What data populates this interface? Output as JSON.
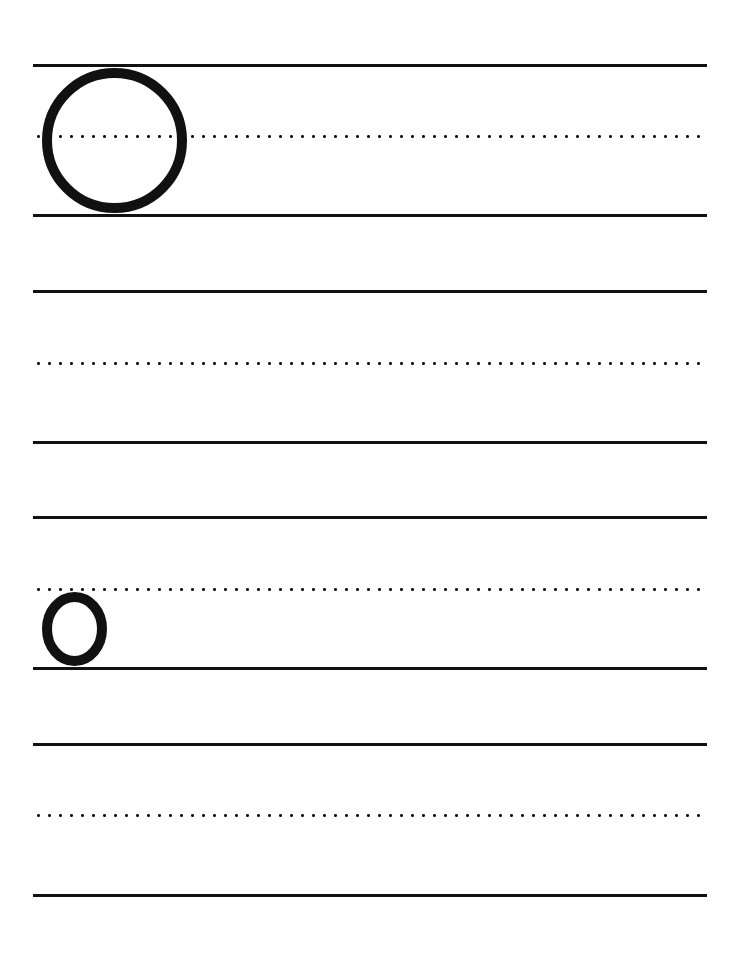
{
  "worksheet": {
    "type": "handwriting-practice",
    "letter": "O",
    "examples": [
      {
        "case": "uppercase",
        "glyph": "O"
      },
      {
        "case": "lowercase",
        "glyph": "o"
      }
    ],
    "rows": [
      {
        "top_line": 65,
        "mid_line": 136,
        "base_line": 215
      },
      {
        "top_line": 291,
        "mid_line": 363,
        "base_line": 442
      },
      {
        "top_line": 517,
        "mid_line": 589,
        "base_line": 668
      },
      {
        "top_line": 744,
        "mid_line": 815,
        "base_line": 895
      }
    ],
    "colors": {
      "ink": "#111111",
      "paper": "#ffffff"
    }
  }
}
